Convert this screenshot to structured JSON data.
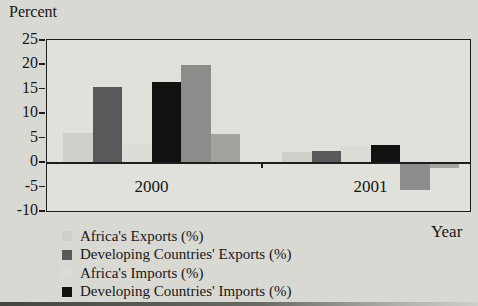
{
  "figure": {
    "y_axis_title": "Percent",
    "x_axis_title": "Year"
  },
  "chart_data": {
    "type": "bar",
    "title": "",
    "ylabel": "Percent",
    "xlabel": "Year",
    "ylim": [
      -10,
      25
    ],
    "yticks": [
      25,
      20,
      15,
      10,
      5,
      0,
      -5,
      -10
    ],
    "grid": false,
    "legend_position": "bottom-left",
    "categories": [
      "2000",
      "2001"
    ],
    "series": [
      {
        "name": "Africa's Exports (%)",
        "color": "#cfcfca",
        "values": [
          5.9,
          2.1
        ],
        "in_legend": true
      },
      {
        "name": "Developing Countries' Exports (%)",
        "color": "#59595a",
        "values": [
          15.3,
          2.3
        ],
        "in_legend": true
      },
      {
        "name": "Africa's Imports (%)",
        "color": "#dcdcd7",
        "values": [
          3.7,
          3.4
        ],
        "in_legend": true
      },
      {
        "name": "Developing Countries' Imports (%)",
        "color": "#111111",
        "values": [
          16.5,
          3.6
        ],
        "in_legend": true
      },
      {
        "name": "unlabeled gray series",
        "color": "#8c8c8a",
        "values": [
          19.9,
          -5.7
        ],
        "in_legend": false
      },
      {
        "name": "unlabeled light-gray series",
        "color": "#a3a3a0",
        "values": [
          5.8,
          -1.1
        ],
        "in_legend": false
      }
    ]
  },
  "legend": {
    "items": [
      {
        "label": "Africa's Exports (%)",
        "color": "#cfcfca"
      },
      {
        "label": "Developing Countries' Exports (%)",
        "color": "#59595a"
      },
      {
        "label": "Africa's Imports (%)",
        "color": "#dcdcd7"
      },
      {
        "label": "Developing Countries' Imports (%)",
        "color": "#111111"
      }
    ]
  }
}
